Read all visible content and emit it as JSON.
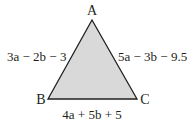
{
  "diagram": {
    "type": "triangle",
    "fill_color": "#d9d9d9",
    "stroke_color": "#231f20",
    "vertices": {
      "A": "A",
      "B": "B",
      "C": "C"
    },
    "sides": {
      "AB": "3a − 2b − 3",
      "AC": "5a − 3b − 9.5",
      "BC": "4a + 5b + 5"
    }
  }
}
